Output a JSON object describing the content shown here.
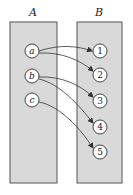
{
  "diagram": {
    "type": "function-mapping",
    "colors": {
      "box_fill": "#d9d9d9",
      "box_stroke": "#555555",
      "node_fill": "#ffffff",
      "node_stroke": "#333333",
      "arrow": "#333333"
    },
    "sets": [
      {
        "id": "A",
        "label": "A",
        "elements": [
          "a",
          "b",
          "c"
        ]
      },
      {
        "id": "B",
        "label": "B",
        "elements": [
          "1",
          "2",
          "3",
          "4",
          "5"
        ]
      }
    ],
    "mapping": [
      {
        "from": "a",
        "to": "1"
      },
      {
        "from": "a",
        "to": "2"
      },
      {
        "from": "b",
        "to": "3"
      },
      {
        "from": "b",
        "to": "4"
      },
      {
        "from": "c",
        "to": "5"
      }
    ]
  }
}
